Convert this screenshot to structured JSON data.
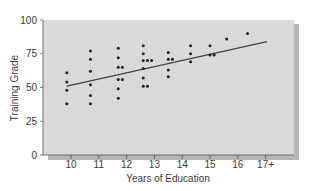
{
  "chart_data": {
    "type": "scatter",
    "title": "",
    "xlabel": "Years of Education",
    "ylabel": "Training Grade",
    "x_ticks": [
      "10",
      "11",
      "12",
      "13",
      "14",
      "15",
      "16",
      "17+"
    ],
    "y_ticks": [
      "0",
      "25",
      "50",
      "75",
      "100"
    ],
    "xlim": [
      9.0,
      18.0
    ],
    "ylim": [
      0,
      100
    ],
    "grid": false,
    "legend": null,
    "colors": {
      "plot_background": "#d9d9d9",
      "point": "#222222",
      "trend_line": "#444444",
      "shadow": "#6e6e6e"
    },
    "series": [
      {
        "name": "Employees",
        "points": [
          [
            9.85,
            61
          ],
          [
            9.85,
            54
          ],
          [
            9.85,
            48
          ],
          [
            9.85,
            38
          ],
          [
            10.7,
            77
          ],
          [
            10.7,
            71
          ],
          [
            10.7,
            62
          ],
          [
            10.7,
            52
          ],
          [
            10.7,
            44
          ],
          [
            10.7,
            38
          ],
          [
            11.7,
            79
          ],
          [
            11.7,
            72
          ],
          [
            11.7,
            65
          ],
          [
            11.85,
            65
          ],
          [
            11.7,
            56
          ],
          [
            11.85,
            56
          ],
          [
            11.7,
            49
          ],
          [
            11.7,
            42
          ],
          [
            12.6,
            81
          ],
          [
            12.6,
            75
          ],
          [
            12.6,
            70
          ],
          [
            12.75,
            70
          ],
          [
            12.9,
            70
          ],
          [
            12.6,
            64
          ],
          [
            12.6,
            57
          ],
          [
            12.6,
            51
          ],
          [
            12.75,
            51
          ],
          [
            13.5,
            76
          ],
          [
            13.5,
            71
          ],
          [
            13.65,
            71
          ],
          [
            13.5,
            63
          ],
          [
            13.5,
            58
          ],
          [
            14.3,
            81
          ],
          [
            14.3,
            75
          ],
          [
            14.3,
            69
          ],
          [
            15.0,
            81
          ],
          [
            15.0,
            74
          ],
          [
            15.15,
            74
          ],
          [
            15.6,
            86
          ],
          [
            16.35,
            90
          ]
        ]
      }
    ],
    "trend_line": {
      "x": [
        9.85,
        17.05
      ],
      "y": [
        51,
        84
      ]
    }
  }
}
